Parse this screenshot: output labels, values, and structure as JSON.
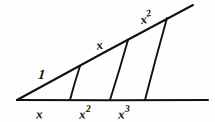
{
  "figure": {
    "background_color": "#fefefe",
    "stroke_color": "#111111",
    "width": 215,
    "height": 122,
    "baseline": {
      "x1": 17,
      "y1": 100,
      "x2": 208,
      "y2": 100
    },
    "upper_ray": {
      "x1": 17,
      "y1": 100,
      "x2": 193,
      "y2": 5
    },
    "transversals": [
      {
        "name": "transversal-1",
        "x_bottom": 70,
        "y_bottom": 100,
        "x_top": 80,
        "y_top": 66
      },
      {
        "name": "transversal-2",
        "x_bottom": 110,
        "y_bottom": 100,
        "x_top": 128,
        "y_top": 40
      },
      {
        "name": "transversal-3",
        "x_bottom": 145,
        "y_bottom": 100,
        "x_top": 167,
        "y_top": 18
      }
    ],
    "hypotenuse_labels": [
      {
        "name": "label-one",
        "base": "1",
        "sup": "",
        "x": 38,
        "y": 66
      },
      {
        "name": "label-x",
        "base": "x",
        "sup": "",
        "x": 96,
        "y": 35
      },
      {
        "name": "label-x-squared-top",
        "base": "x",
        "sup": "2",
        "x": 140,
        "y": 9
      }
    ],
    "baseline_labels": [
      {
        "name": "label-base-x",
        "base": "x",
        "sup": "",
        "x": 36,
        "y": 104
      },
      {
        "name": "label-base-x-squared",
        "base": "x",
        "sup": "2",
        "x": 79,
        "y": 104
      },
      {
        "name": "label-base-x-cubed",
        "base": "x",
        "sup": "3",
        "x": 118,
        "y": 104
      }
    ]
  }
}
